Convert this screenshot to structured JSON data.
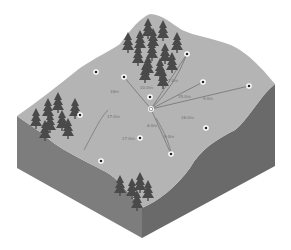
{
  "diagram": {
    "type": "isometric-terrain-block",
    "colors": {
      "background": "#ffffff",
      "top_surface": "#b4b4b4",
      "side_left": "#7d7d7d",
      "side_right": "#6a6a6a",
      "tree": "#4a4a4a",
      "line": "#6a6a6a",
      "point_ring": "#ffffff",
      "point_dot": "#222222"
    },
    "hub": {
      "x": 151,
      "y": 109
    },
    "points": [
      {
        "id": "p1",
        "x": 96,
        "y": 72
      },
      {
        "id": "p2",
        "x": 124,
        "y": 77
      },
      {
        "id": "p3",
        "x": 187,
        "y": 54
      },
      {
        "id": "p4",
        "x": 203,
        "y": 82
      },
      {
        "id": "p5",
        "x": 249,
        "y": 86
      },
      {
        "id": "p6",
        "x": 150,
        "y": 97
      },
      {
        "id": "p7",
        "x": 80,
        "y": 115
      },
      {
        "id": "p8",
        "x": 206,
        "y": 128
      },
      {
        "id": "p9",
        "x": 140,
        "y": 138
      },
      {
        "id": "p10",
        "x": 171,
        "y": 154
      },
      {
        "id": "p11",
        "x": 101,
        "y": 161
      }
    ],
    "connections": [
      {
        "to": "p2"
      },
      {
        "to": "p3"
      },
      {
        "to": "p3",
        "curved": true
      },
      {
        "to": "p4"
      },
      {
        "to": "p5"
      },
      {
        "to": "p10"
      }
    ],
    "distance_labels": [
      {
        "text": "18m",
        "x": 110,
        "y": 93
      },
      {
        "text": "10.0m",
        "x": 140,
        "y": 89
      },
      {
        "text": "7.0m",
        "x": 168,
        "y": 82
      },
      {
        "text": "15.0m",
        "x": 178,
        "y": 98
      },
      {
        "text": "9.0m",
        "x": 203,
        "y": 100
      },
      {
        "text": "16.0m",
        "x": 181,
        "y": 119
      },
      {
        "text": "17.0m",
        "x": 107,
        "y": 118
      },
      {
        "text": "6.0m",
        "x": 147,
        "y": 127
      },
      {
        "text": "17.0m",
        "x": 122,
        "y": 140
      },
      {
        "text": "9.0m",
        "x": 164,
        "y": 138
      }
    ],
    "tree_clusters": [
      {
        "name": "north-forest",
        "trees": [
          [
            148,
            18
          ],
          [
            163,
            20
          ],
          [
            128,
            32
          ],
          [
            140,
            30
          ],
          [
            153,
            28
          ],
          [
            177,
            32
          ],
          [
            138,
            45
          ],
          [
            152,
            40
          ],
          [
            165,
            43
          ],
          [
            148,
            55
          ],
          [
            160,
            58
          ],
          [
            172,
            52
          ],
          [
            145,
            62
          ],
          [
            163,
            68
          ]
        ]
      },
      {
        "name": "west-forest",
        "trees": [
          [
            36,
            108
          ],
          [
            48,
            98
          ],
          [
            58,
            92
          ],
          [
            75,
            98
          ],
          [
            50,
            112
          ],
          [
            62,
            110
          ],
          [
            68,
            118
          ],
          [
            45,
            120
          ]
        ]
      },
      {
        "name": "south-forest",
        "trees": [
          [
            120,
            175
          ],
          [
            132,
            178
          ],
          [
            140,
            172
          ],
          [
            148,
            180
          ],
          [
            137,
            190
          ]
        ]
      }
    ],
    "streams": [
      {
        "name": "west-stream",
        "path": "M108,110 C100,118 95,130 84,150"
      },
      {
        "name": "south-stream",
        "path": "M156,118 C162,128 168,140 171,152"
      }
    ]
  }
}
